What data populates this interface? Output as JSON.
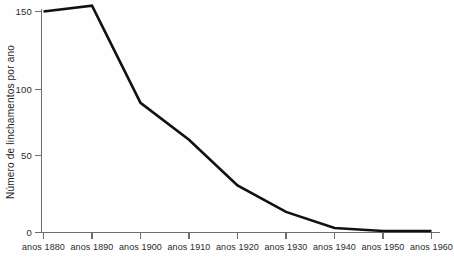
{
  "chart_data": {
    "type": "line",
    "title": "",
    "subtitle": "",
    "xlabel": "",
    "ylabel": "Número de linchamentos por ano",
    "categories": [
      "anos 1880",
      "anos 1890",
      "anos 1900",
      "anos 1910",
      "anos 1920",
      "anos 1930",
      "anos 1940",
      "anos 1950",
      "anos 1960"
    ],
    "x": [
      1880,
      1890,
      1900,
      1910,
      1920,
      1930,
      1940,
      1950,
      1960
    ],
    "values": [
      150,
      154,
      88,
      63,
      32,
      14,
      3,
      1,
      1
    ],
    "series": [
      {
        "name": "Número de linchamentos por ano",
        "values": [
          150,
          154,
          88,
          63,
          32,
          14,
          3,
          1,
          1
        ]
      }
    ],
    "ylim": [
      0,
      158
    ],
    "xlim": [
      "anos 1880",
      "anos 1960"
    ],
    "ytick_labels": [
      "0",
      "50",
      "100",
      "150"
    ],
    "ytick_values": [
      0,
      50,
      100,
      150
    ],
    "grid": false,
    "legend": false,
    "legend_position": "none",
    "line_color": "#111111",
    "axis_color": "#6d6d6d",
    "background_color": "#ffffff",
    "annotations": []
  },
  "axes": {
    "y_axis_name": "y-axis",
    "x_axis_name": "x-axis"
  }
}
